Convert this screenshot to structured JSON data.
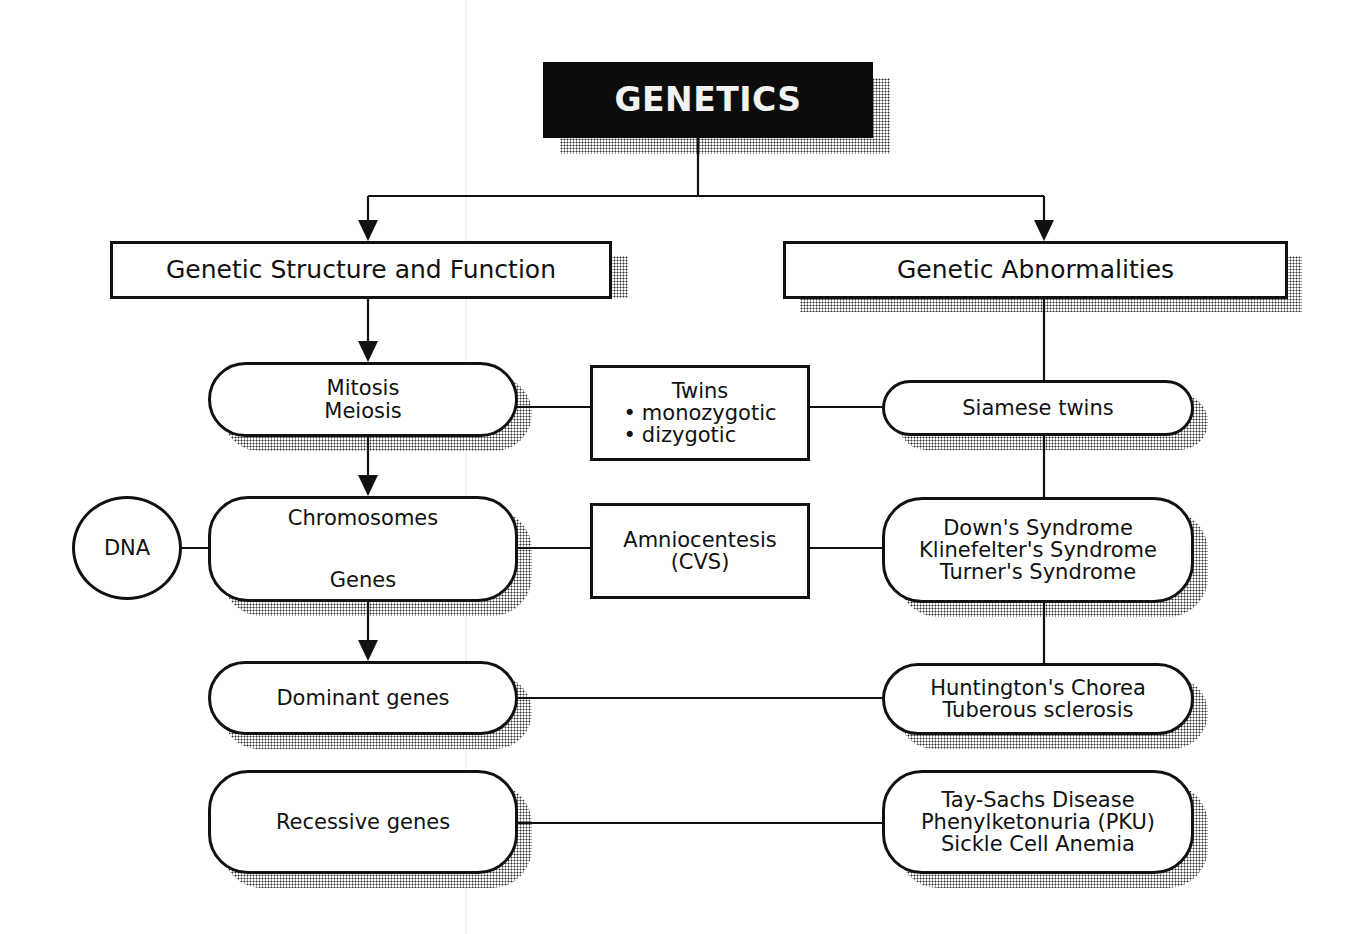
{
  "diagram": {
    "title": "GENETICS",
    "categories": {
      "left": "Genetic Structure and Function",
      "right": "Genetic Abnormalities"
    },
    "left_column": {
      "cell_division": [
        "Mitosis",
        "Meiosis"
      ],
      "hereditary_units": [
        "Chromosomes",
        "Genes"
      ],
      "dominant": "Dominant genes",
      "recessive": "Recessive genes"
    },
    "side_node": {
      "dna": "DNA"
    },
    "middle_column": {
      "twins": {
        "heading": "Twins",
        "bullets": [
          "monozygotic",
          "dizygotic"
        ]
      },
      "prenatal_test": [
        "Amniocentesis",
        "(CVS)"
      ]
    },
    "right_column": {
      "conjoined": "Siamese twins",
      "chromosomal": [
        "Down's Syndrome",
        "Klinefelter's Syndrome",
        "Turner's Syndrome"
      ],
      "dominant_disorders": [
        "Huntington's Chorea",
        "Tuberous sclerosis"
      ],
      "recessive_disorders": [
        "Tay-Sachs Disease",
        "Phenylketonuria (PKU)",
        "Sickle Cell Anemia"
      ]
    },
    "colors": {
      "ink": "#111111",
      "title_fill": "#0d0d0d",
      "title_text": "#f2f2f2",
      "background": "#ffffff",
      "shadow_dots": "#333333"
    }
  }
}
